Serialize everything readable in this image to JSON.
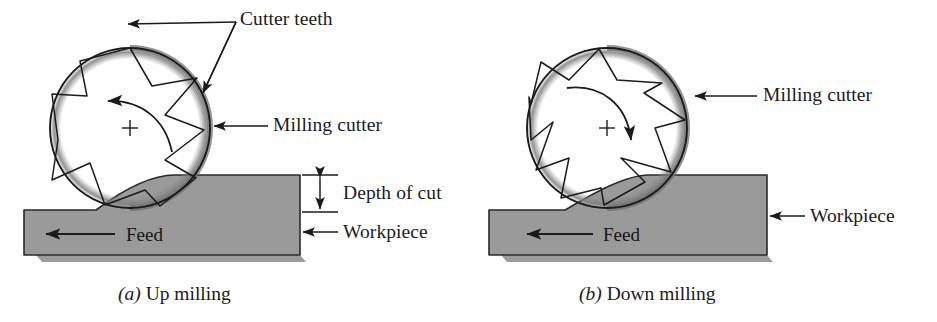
{
  "figure": {
    "background_color": "#ffffff",
    "ink_color": "#1b1b1b",
    "workpiece_fill": "#9a9a9a",
    "workpiece_edge": "#2a2a2a",
    "shadow_color": "#8d8d8d"
  },
  "panels": [
    {
      "id": "up-milling",
      "caption_index": "(a)",
      "caption_text": "Up milling",
      "rotation_direction": "counterclockwise",
      "cutter": {
        "center_x": 130,
        "center_y": 128,
        "radius": 80,
        "teeth_count": 6,
        "center_mark": "+"
      },
      "labels": {
        "cutter_teeth": "Cutter teeth",
        "milling_cutter": "Milling cutter",
        "depth_of_cut": "Depth of cut",
        "workpiece": "Workpiece",
        "feed": "Feed"
      },
      "feed_direction": "left"
    },
    {
      "id": "down-milling",
      "caption_index": "(b)",
      "caption_text": "Down milling",
      "rotation_direction": "clockwise",
      "cutter": {
        "center_x": 138,
        "center_y": 128,
        "radius": 80,
        "teeth_count": 6,
        "center_mark": "+"
      },
      "labels": {
        "milling_cutter": "Milling cutter",
        "workpiece": "Workpiece",
        "feed": "Feed"
      },
      "feed_direction": "left"
    }
  ]
}
